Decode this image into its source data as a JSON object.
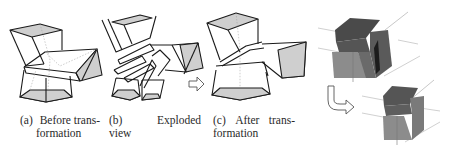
{
  "figure": {
    "panels": [
      {
        "id": "a",
        "label": "(a)",
        "caption_line1": "Before trans-",
        "caption_line2": "formation"
      },
      {
        "id": "b",
        "label": "(b)",
        "caption_word": "Exploded",
        "caption_line2": "view"
      },
      {
        "id": "c",
        "label": "(c)",
        "caption_word1": "After",
        "caption_word2": "trans-",
        "caption_line2": "formation"
      }
    ],
    "colors": {
      "line": "#1a1a1a",
      "face_shade": "#cfcfcf",
      "hidden_line": "#9a9a9a",
      "dark_cube": "#5a5a5a",
      "dark_cube_top": "#4a4a4a",
      "light_cube": "#8c8c8c",
      "guide_line": "#b0b0b0"
    },
    "arrows": [
      {
        "type": "right-outline-arrow",
        "between": "b-c"
      },
      {
        "type": "curved-down-right-arrow",
        "between": "render-top-bottom"
      }
    ]
  }
}
